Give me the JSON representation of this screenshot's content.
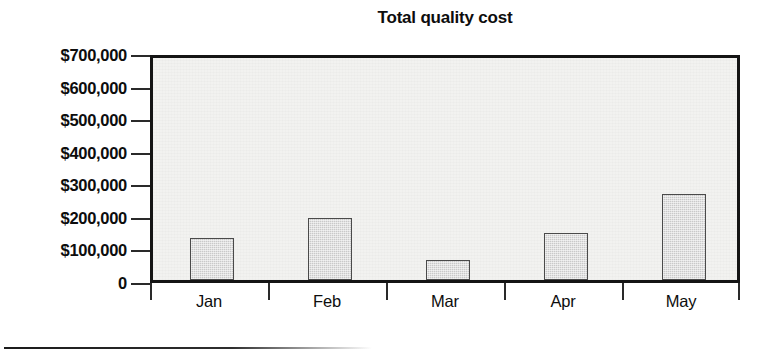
{
  "chart_data": {
    "type": "bar",
    "title": "Total quality cost",
    "xlabel": "",
    "ylabel": "",
    "categories": [
      "Jan",
      "Feb",
      "Mar",
      "Apr",
      "May"
    ],
    "values": [
      130000,
      190000,
      60000,
      145000,
      265000
    ],
    "ylim": [
      0,
      700000
    ],
    "ytick_values": [
      700000,
      600000,
      500000,
      400000,
      300000,
      200000,
      100000,
      0
    ],
    "ytick_labels": [
      "$700,000",
      "$600,000",
      "$500,000",
      "$400,000",
      "$300,000",
      "$200,000",
      "$100,000",
      "0"
    ],
    "grid": false,
    "legend": null,
    "series": [
      {
        "name": "Total quality cost",
        "values": [
          130000,
          190000,
          60000,
          145000,
          265000
        ]
      }
    ],
    "bar_fill_color": "#c9c9c9",
    "bar_border_color": "#4a4a4a",
    "plot_background_color": "#f2f2f0",
    "frame_color": "#141414",
    "text_color": "#0d0d0d"
  },
  "figure": {
    "background_color": "#ffffff",
    "footer_rule_color": "#1b1b1b"
  }
}
